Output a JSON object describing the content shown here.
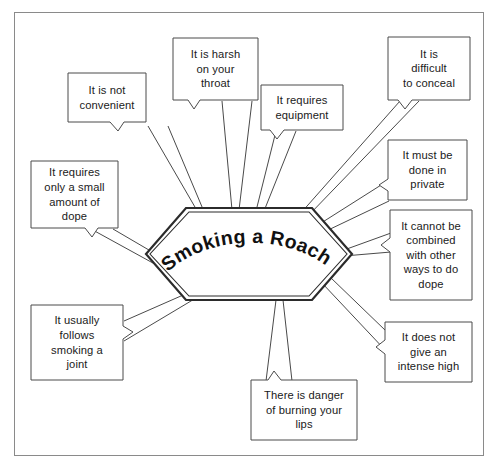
{
  "diagram": {
    "type": "spider-web-concept-map",
    "title": "Smoking a Roach",
    "center": {
      "label": "Smoking a Roach",
      "shape": "hexagon"
    },
    "frame": {
      "border_color": "#8a8a8a",
      "background": "#ffffff"
    },
    "ink_color": "#3a3a3a",
    "text_color": "#1a1a1a",
    "nodes": [
      {
        "id": "not-convenient",
        "text": "It is not\nconvenient"
      },
      {
        "id": "harsh-throat",
        "text": "It is harsh\non your\nthroat"
      },
      {
        "id": "requires-equipment",
        "text": "It requires\nequipment"
      },
      {
        "id": "difficult-conceal",
        "text": "It is\ndifficult\nto conceal"
      },
      {
        "id": "done-in-private",
        "text": "It must be\ndone in\nprivate"
      },
      {
        "id": "cannot-combine",
        "text": "It cannot be\ncombined\nwith other\nways to do\ndope"
      },
      {
        "id": "not-intense-high",
        "text": "It does not\ngive an\nintense high"
      },
      {
        "id": "danger-burn-lips",
        "text": "There is danger\nof burning your\nlips"
      },
      {
        "id": "follows-joint",
        "text": "It usually\nfollows\nsmoking a\njoint"
      },
      {
        "id": "small-amount-dope",
        "text": "It requires\nonly a small\namount of\ndope"
      }
    ]
  }
}
